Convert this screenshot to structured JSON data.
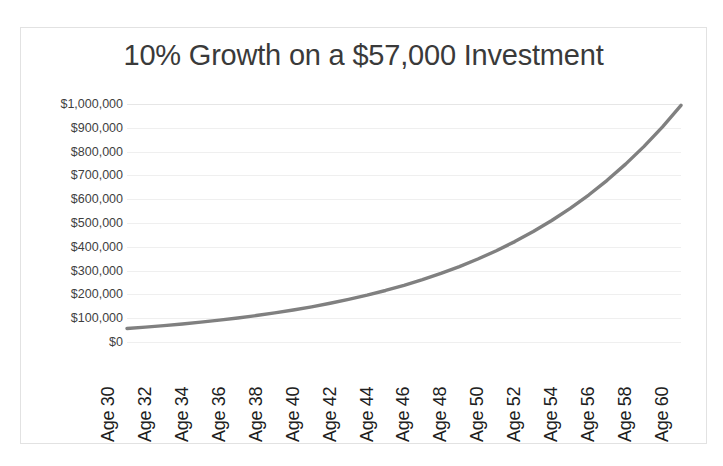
{
  "chart_data": {
    "type": "line",
    "title": "10% Growth on a $57,000 Investment",
    "xlabel": "",
    "ylabel": "",
    "grid": true,
    "legend": "none",
    "line_color": "#808080",
    "x_tick_labels": [
      "Age 30",
      "Age 32",
      "Age 34",
      "Age 36",
      "Age 38",
      "Age 40",
      "Age 42",
      "Age 44",
      "Age 46",
      "Age 48",
      "Age 50",
      "Age 52",
      "Age 54",
      "Age 56",
      "Age 58",
      "Age 60"
    ],
    "y_tick_labels": [
      "$1,000,000",
      "$900,000",
      "$800,000",
      "$700,000",
      "$600,000",
      "$500,000",
      "$400,000",
      "$300,000",
      "$200,000",
      "$100,000",
      "$0"
    ],
    "y_tick_values": [
      1000000,
      900000,
      800000,
      700000,
      600000,
      500000,
      400000,
      300000,
      200000,
      100000,
      0
    ],
    "ylim": [
      0,
      1000000
    ],
    "xlim": [
      30,
      60
    ],
    "x": [
      30,
      31,
      32,
      33,
      34,
      35,
      36,
      37,
      38,
      39,
      40,
      41,
      42,
      43,
      44,
      45,
      46,
      47,
      48,
      49,
      50,
      51,
      52,
      53,
      54,
      55,
      56,
      57,
      58,
      59,
      60
    ],
    "values": [
      57000,
      62700,
      68970,
      75867,
      83454,
      91799,
      100979,
      111077,
      122184,
      134403,
      147843,
      162627,
      178890,
      196779,
      216457,
      238103,
      261913,
      288104,
      316915,
      348606,
      383467,
      421814,
      463995,
      510395,
      561434,
      617577,
      679335,
      747269,
      821996,
      904195,
      994615
    ],
    "series_name": "Investment Value"
  },
  "figure": {
    "background": "#ffffff",
    "border_color": "#e2e2e2",
    "gridline_color": "#efefef",
    "title_color": "#3a3a3a"
  }
}
